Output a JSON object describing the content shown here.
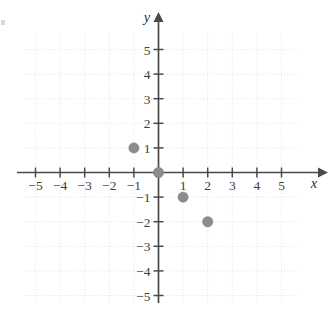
{
  "chart_data": {
    "type": "scatter",
    "title": "",
    "xlabel": "x",
    "ylabel": "y",
    "xlim": [
      -6,
      6
    ],
    "ylim": [
      -6,
      6
    ],
    "grid": true,
    "legend": null,
    "x_ticks": [
      -5,
      -4,
      -3,
      -2,
      -1,
      1,
      2,
      3,
      4,
      5
    ],
    "y_ticks": [
      5,
      4,
      3,
      2,
      1,
      -1,
      -2,
      -3,
      -4,
      -5
    ],
    "x_tick_labels": [
      "−5",
      "−4",
      "−3",
      "−2",
      "−1",
      "1",
      "2",
      "3",
      "4",
      "5"
    ],
    "y_tick_labels": [
      "5",
      "4",
      "3",
      "2",
      "1",
      "−1",
      "−2",
      "−3",
      "−4",
      "−5"
    ],
    "points": [
      {
        "x": -1,
        "y": 1,
        "label": "(-1, 1)"
      },
      {
        "x": 0,
        "y": 0,
        "label": "(0, 0)"
      },
      {
        "x": 1,
        "y": -1,
        "label": "(1, -1)"
      },
      {
        "x": 2,
        "y": -2,
        "label": "(2, -2)"
      }
    ],
    "point_color": "#8c8c8c",
    "axis_color": "#4a4a4a",
    "grid_color": "#cfd4dc"
  },
  "axes": {
    "x_axis_name": "x",
    "y_axis_name": "y"
  }
}
